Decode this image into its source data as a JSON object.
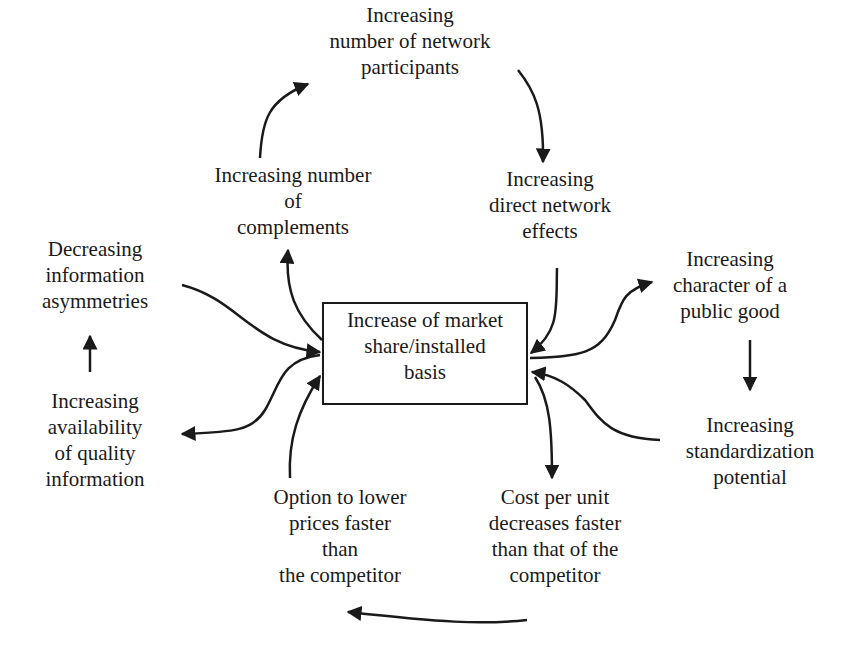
{
  "diagram": {
    "type": "cause-effect cycle",
    "center": {
      "id": "market-share",
      "lines": [
        "Increase of market",
        "share/installed",
        "basis"
      ]
    },
    "nodes": [
      {
        "id": "network-participants",
        "lines": [
          "Increasing",
          "number of network",
          "participants"
        ]
      },
      {
        "id": "complements",
        "lines": [
          "Increasing number",
          "of",
          "complements"
        ]
      },
      {
        "id": "direct-network-effects",
        "lines": [
          "Increasing",
          "direct network",
          "effects"
        ]
      },
      {
        "id": "info-asymmetries",
        "lines": [
          "Decreasing",
          "information",
          "asymmetries"
        ]
      },
      {
        "id": "public-good",
        "lines": [
          "Increasing",
          "character of a",
          "public good"
        ]
      },
      {
        "id": "quality-information",
        "lines": [
          "Increasing",
          "availability",
          "of quality",
          "information"
        ]
      },
      {
        "id": "standardization",
        "lines": [
          "Increasing",
          "standardization",
          "potential"
        ]
      },
      {
        "id": "lower-prices",
        "lines": [
          "Option to lower",
          "prices faster",
          "than",
          "the competitor"
        ]
      },
      {
        "id": "cost-per-unit",
        "lines": [
          "Cost per unit",
          "decreases faster",
          "than that of the",
          "competitor"
        ]
      }
    ],
    "edges": [
      {
        "from": "complements",
        "to": "network-participants"
      },
      {
        "from": "network-participants",
        "to": "direct-network-effects"
      },
      {
        "from": "direct-network-effects",
        "to": "market-share"
      },
      {
        "from": "market-share",
        "to": "complements"
      },
      {
        "from": "info-asymmetries",
        "to": "market-share"
      },
      {
        "from": "quality-information",
        "to": "info-asymmetries"
      },
      {
        "from": "market-share",
        "to": "quality-information"
      },
      {
        "from": "market-share",
        "to": "public-good"
      },
      {
        "from": "public-good",
        "to": "standardization"
      },
      {
        "from": "standardization",
        "to": "market-share"
      },
      {
        "from": "market-share",
        "to": "cost-per-unit"
      },
      {
        "from": "cost-per-unit",
        "to": "lower-prices"
      },
      {
        "from": "lower-prices",
        "to": "market-share"
      }
    ]
  }
}
